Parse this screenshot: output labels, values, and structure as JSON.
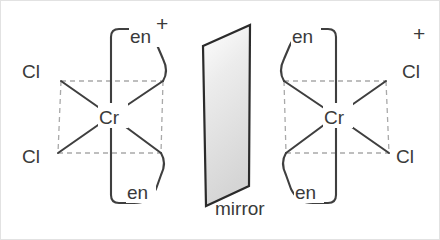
{
  "figure": {
    "background_color": "#ffffff",
    "border_color": "#e2e2e2",
    "bond_color": "#3f3f3f",
    "dashed_bond_color": "#a9a9a9",
    "text_color": "#3a3a3a",
    "mirror_fill_top": "#ffffff",
    "mirror_fill_bottom": "#d8d8d8"
  },
  "left_complex": {
    "metal_label": "Cr",
    "charge_label": "+",
    "chlorine_top_label": "Cl",
    "chlorine_bottom_label": "Cl",
    "ligand_top_label": "en",
    "ligand_bottom_label": "en"
  },
  "mirror": {
    "label": "mirror"
  },
  "right_complex": {
    "metal_label": "Cr",
    "charge_label": "+",
    "chlorine_top_label": "Cl",
    "chlorine_bottom_label": "Cl",
    "ligand_top_label": "en",
    "ligand_bottom_label": "en"
  }
}
